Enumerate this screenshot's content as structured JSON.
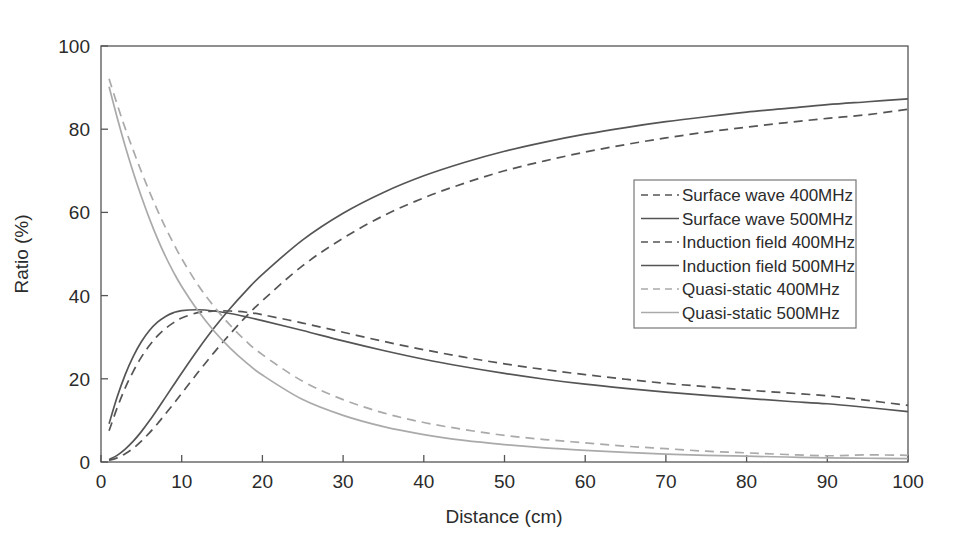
{
  "chart_data": {
    "type": "line",
    "title": "",
    "xlabel": "Distance (cm)",
    "ylabel": "Ratio (%)",
    "xlim": [
      0,
      100
    ],
    "ylim": [
      0,
      100
    ],
    "xticks": [
      0,
      10,
      20,
      30,
      40,
      50,
      60,
      70,
      80,
      90,
      100
    ],
    "yticks": [
      0,
      20,
      40,
      60,
      80,
      100
    ],
    "grid": false,
    "legend_position": "center-right",
    "x": [
      1,
      2,
      3,
      4,
      5,
      6,
      7,
      8,
      9,
      10,
      12,
      14,
      16,
      18,
      20,
      25,
      30,
      35,
      40,
      45,
      50,
      55,
      60,
      65,
      70,
      75,
      80,
      85,
      90,
      95,
      100
    ],
    "series": [
      {
        "name": "Surface wave 400MHz",
        "frequency_mhz": 400,
        "style": "dashed",
        "color": "#555555",
        "values": [
          0.4,
          1.0,
          2.0,
          3.3,
          5.0,
          7.0,
          9.2,
          11.6,
          14.0,
          16.5,
          21.5,
          26.3,
          30.8,
          35.0,
          38.8,
          47.2,
          53.8,
          59.2,
          63.5,
          67.0,
          70.0,
          72.4,
          74.5,
          76.3,
          77.9,
          79.3,
          80.5,
          81.6,
          82.6,
          83.5,
          84.8
        ]
      },
      {
        "name": "Surface wave 500MHz",
        "frequency_mhz": 500,
        "style": "solid",
        "color": "#555555",
        "values": [
          0.6,
          1.6,
          3.1,
          5.0,
          7.3,
          9.9,
          12.7,
          15.6,
          18.5,
          21.4,
          27.0,
          32.2,
          36.9,
          41.2,
          45.1,
          53.4,
          59.8,
          64.8,
          68.8,
          72.0,
          74.7,
          76.9,
          78.8,
          80.4,
          81.8,
          83.0,
          84.1,
          85.0,
          85.9,
          86.6,
          87.3
        ]
      },
      {
        "name": "Induction field 400MHz",
        "frequency_mhz": 400,
        "style": "dashed",
        "color": "#555555",
        "values": [
          7.5,
          13.0,
          17.8,
          21.8,
          25.2,
          28.0,
          30.3,
          32.1,
          33.5,
          34.6,
          35.9,
          36.3,
          36.3,
          36.0,
          35.4,
          33.4,
          31.2,
          29.0,
          27.0,
          25.2,
          23.6,
          22.2,
          21.0,
          19.9,
          18.9,
          18.1,
          17.3,
          16.6,
          15.9,
          14.8,
          13.6
        ]
      },
      {
        "name": "Induction field 500MHz",
        "frequency_mhz": 500,
        "style": "solid",
        "color": "#555555",
        "values": [
          9.2,
          15.6,
          21.0,
          25.4,
          28.9,
          31.6,
          33.6,
          35.0,
          35.9,
          36.4,
          36.6,
          36.3,
          35.7,
          34.9,
          34.0,
          31.6,
          29.1,
          26.8,
          24.7,
          22.9,
          21.3,
          19.9,
          18.7,
          17.7,
          16.8,
          16.0,
          15.3,
          14.6,
          14.0,
          13.1,
          12.1
        ]
      },
      {
        "name": "Quasi-static 400MHz",
        "frequency_mhz": 400,
        "style": "dashed",
        "color": "#aaaaaa",
        "values": [
          92.1,
          86.0,
          80.2,
          74.9,
          69.8,
          65.0,
          60.5,
          56.3,
          52.5,
          48.9,
          42.6,
          37.4,
          32.9,
          29.0,
          25.8,
          19.4,
          15.0,
          11.8,
          9.5,
          7.8,
          6.4,
          5.4,
          4.6,
          3.8,
          3.2,
          2.6,
          2.2,
          1.8,
          1.5,
          1.7,
          1.6
        ]
      },
      {
        "name": "Quasi-static 500MHz",
        "frequency_mhz": 500,
        "style": "solid",
        "color": "#aaaaaa",
        "values": [
          90.2,
          82.8,
          75.9,
          69.6,
          63.8,
          58.5,
          53.7,
          49.4,
          45.6,
          42.2,
          36.4,
          31.5,
          27.4,
          23.9,
          20.9,
          15.0,
          11.2,
          8.5,
          6.6,
          5.2,
          4.2,
          3.4,
          2.8,
          2.3,
          1.9,
          1.6,
          1.4,
          1.2,
          1.0,
          0.9,
          0.8
        ]
      }
    ]
  },
  "legend": {
    "items": [
      {
        "label": "Surface wave 400MHz"
      },
      {
        "label": "Surface wave 500MHz"
      },
      {
        "label": "Induction field 400MHz"
      },
      {
        "label": "Induction field 500MHz"
      },
      {
        "label": "Quasi-static 400MHz"
      },
      {
        "label": "Quasi-static 500MHz"
      }
    ]
  }
}
